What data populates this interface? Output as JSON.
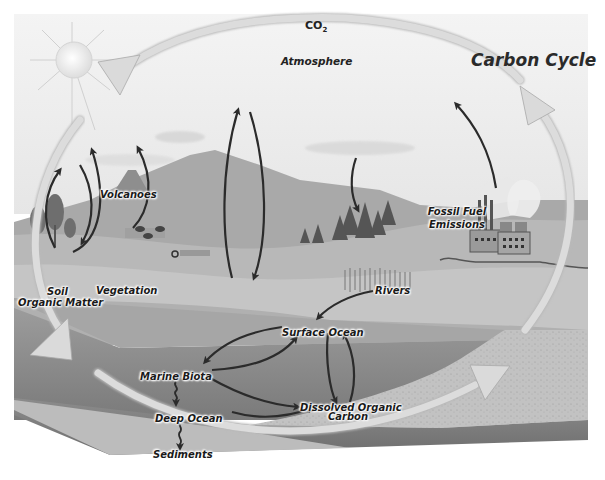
{
  "diagram": {
    "title": "Carbon Cycle",
    "atmosphere_label": "Atmosphere",
    "co2_label": "CO",
    "co2_subscript": "2",
    "nodes": {
      "volcanoes": "Volcanoes",
      "vegetation": "Vegetation",
      "soil": "Soil",
      "organic_matter": "Organic Matter",
      "fossil_fuel_line1": "Fossil Fuel",
      "fossil_fuel_line2": "Emissions",
      "rivers": "Rivers",
      "surface_ocean": "Surface Ocean",
      "marine_biota": "Marine Biota",
      "deep_ocean": "Deep Ocean",
      "dissolved_line1": "Dissolved Organic",
      "dissolved_line2": "Carbon",
      "sediments": "Sediments"
    },
    "flows": [
      {
        "from": "Soil Organic Matter",
        "to": "Atmosphere"
      },
      {
        "from": "Atmosphere",
        "to": "Soil Organic Matter"
      },
      {
        "from": "Soil Organic Matter",
        "to": "Atmosphere (via Volcanoes)"
      },
      {
        "from": "Vegetation",
        "to": "Atmosphere"
      },
      {
        "from": "Land",
        "to": "Atmosphere"
      },
      {
        "from": "Atmosphere",
        "to": "Land"
      },
      {
        "from": "Atmosphere",
        "to": "Forest"
      },
      {
        "from": "Fossil Fuel Emissions",
        "to": "Atmosphere"
      },
      {
        "from": "Rivers",
        "to": "Surface Ocean"
      },
      {
        "from": "Surface Ocean",
        "to": "Marine Biota"
      },
      {
        "from": "Marine Biota",
        "to": "Surface Ocean"
      },
      {
        "from": "Surface Ocean",
        "to": "Dissolved Organic Carbon"
      },
      {
        "from": "Dissolved Organic Carbon",
        "to": "Surface Ocean"
      },
      {
        "from": "Marine Biota",
        "to": "Dissolved Organic Carbon"
      },
      {
        "from": "Marine Biota",
        "to": "Deep Ocean"
      },
      {
        "from": "Deep Ocean",
        "to": "Dissolved Organic Carbon"
      },
      {
        "from": "Deep Ocean",
        "to": "Sediments"
      }
    ],
    "colors": {
      "sky": "#f2f2f2",
      "mountain": "#a8a8a8",
      "land": "#b5b5b5",
      "ocean_surface": "#9a9a9a",
      "ocean_deep": "#858585",
      "sediment": "#c4c4c4",
      "arrow_dark": "#2b2b2b",
      "cycle_arrow": "#dcdcdc"
    }
  }
}
